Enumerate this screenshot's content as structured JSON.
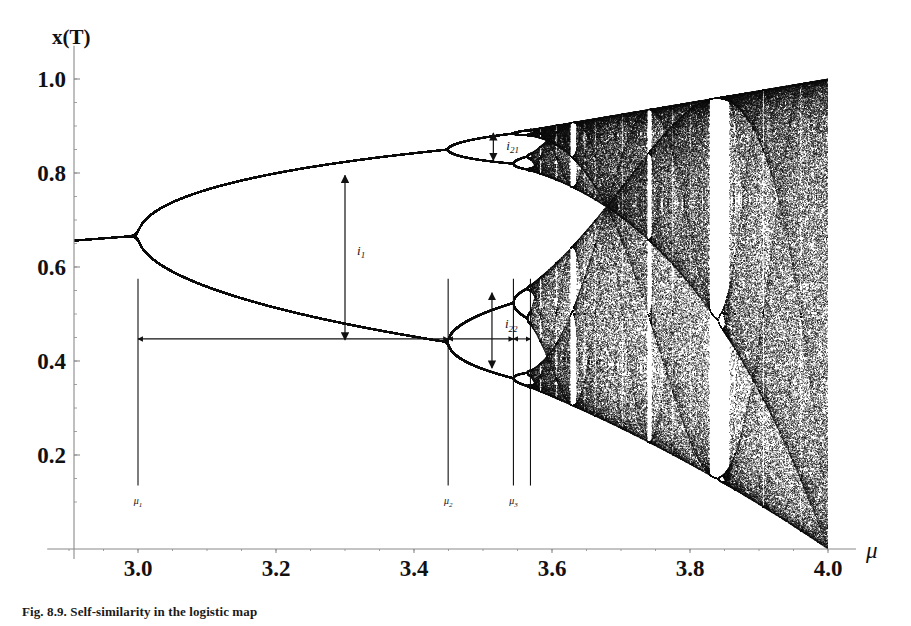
{
  "figure": {
    "caption": "Fig. 8.9.  Self-similarity in the logistic map",
    "y_axis_title": "x(T)",
    "x_axis_title": "μ"
  },
  "axes": {
    "x_ticks": [
      "3.0",
      "3.2",
      "3.4",
      "3.6",
      "3.8",
      "4.0"
    ],
    "x_tick_values": [
      3.0,
      3.2,
      3.4,
      3.6,
      3.8,
      4.0
    ],
    "y_ticks": [
      "1.0",
      "0.8",
      "0.6",
      "0.4",
      "0.2"
    ],
    "y_tick_values": [
      1.0,
      0.8,
      0.6,
      0.4,
      0.2
    ],
    "xlim": [
      2.88,
      4.04
    ],
    "ylim": [
      0.0,
      1.045
    ],
    "axis_color": "#8a8a8a"
  },
  "annotations": {
    "intervals": [
      {
        "name": "i1",
        "base": "i",
        "sub": "1",
        "x": 3.3,
        "y_top": 0.795,
        "y_bottom": 0.445,
        "label_dx": 12,
        "label_dy": -3
      },
      {
        "name": "i21",
        "base": "i",
        "sub": "21",
        "x": 3.515,
        "y_top": 0.885,
        "y_bottom": 0.827,
        "label_dx": 13,
        "label_dy": 3
      },
      {
        "name": "i22",
        "base": "i",
        "sub": "22",
        "x": 3.513,
        "y_top": 0.545,
        "y_bottom": 0.385,
        "label_dx": 13,
        "label_dy": -2
      }
    ],
    "mu_markers": [
      {
        "name": "mu1",
        "base": "μ",
        "sub": "1",
        "x": 3.0,
        "line_top_y": 0.575,
        "line_bottom_y": 0.135,
        "show_label": true
      },
      {
        "name": "mu2",
        "base": "μ",
        "sub": "2",
        "x": 3.4495,
        "line_top_y": 0.575,
        "line_bottom_y": 0.135,
        "show_label": true
      },
      {
        "name": "mu3",
        "base": "μ",
        "sub": "3",
        "x": 3.5441,
        "line_top_y": 0.575,
        "line_bottom_y": 0.135,
        "show_label": true
      },
      {
        "name": "mu4",
        "base": "μ",
        "sub": "4",
        "x": 3.5688,
        "line_top_y": 0.575,
        "line_bottom_y": 0.135,
        "show_label": false
      }
    ],
    "span_arrows": [
      {
        "name": "span-mu1-mu2",
        "x_from": 3.0,
        "x_to": 3.4495,
        "y": 0.447
      },
      {
        "name": "span-mu2-mu3",
        "x_from": 3.4495,
        "x_to": 3.5441,
        "y": 0.447
      },
      {
        "name": "span-mu3-mu4",
        "x_from": 3.5441,
        "x_to": 3.5688,
        "y": 0.447
      }
    ]
  },
  "chart_data": {
    "type": "line",
    "title": "Self-similarity in the logistic map",
    "xlabel": "μ",
    "ylabel": "x(T)",
    "xlim": [
      2.88,
      4.04
    ],
    "ylim": [
      0.0,
      1.045
    ],
    "grid": false,
    "legend": "none",
    "map": {
      "equation": "x_{n+1} = mu * x_n * (1 - x_n)",
      "transient_iterations": 320,
      "plotted_iterations": 260
    },
    "bifurcation_points": [
      {
        "label": "mu1",
        "mu": 3.0,
        "period_before": 1,
        "period_after": 2
      },
      {
        "label": "mu2",
        "mu": 3.4495,
        "period_before": 2,
        "period_after": 4
      },
      {
        "label": "mu3",
        "mu": 3.5441,
        "period_before": 4,
        "period_after": 8
      },
      {
        "label": "mu4",
        "mu": 3.5688,
        "period_before": 8,
        "period_after": 16
      }
    ],
    "feigenbaum_accumulation": 3.5699,
    "periodic_windows": [
      {
        "name": "period-6-window",
        "mu_start": 3.626,
        "mu_end": 3.636
      },
      {
        "name": "period-5-window",
        "mu_start": 3.738,
        "mu_end": 3.745
      },
      {
        "name": "period-3-window",
        "mu_start": 3.828,
        "mu_end": 3.857
      }
    ],
    "interval_measurements": [
      {
        "label": "i1",
        "mu": 3.3,
        "upper_branch": 0.795,
        "lower_branch": 0.445,
        "width": 0.35
      },
      {
        "label": "i21",
        "mu": 3.515,
        "upper_branch": 0.885,
        "lower_branch": 0.827,
        "width": 0.058
      },
      {
        "label": "i22",
        "mu": 3.513,
        "upper_branch": 0.545,
        "lower_branch": 0.385,
        "width": 0.16
      }
    ],
    "sampled_branches": {
      "note": "x values of the attractor branches sampled at selected mu",
      "mu": [
        2.9,
        3.0,
        3.1,
        3.2,
        3.3,
        3.4,
        3.4495,
        3.5,
        3.55,
        3.6,
        3.7,
        3.8,
        3.9,
        4.0
      ],
      "branches": [
        {
          "mu": 2.9,
          "x": [
            0.655
          ]
        },
        {
          "mu": 3.0,
          "x": [
            0.667
          ]
        },
        {
          "mu": 3.1,
          "x": [
            0.558,
            0.765
          ]
        },
        {
          "mu": 3.2,
          "x": [
            0.513,
            0.799
          ]
        },
        {
          "mu": 3.3,
          "x": [
            0.479,
            0.824
          ]
        },
        {
          "mu": 3.4,
          "x": [
            0.452,
            0.842
          ]
        },
        {
          "mu": 3.4495,
          "x": [
            0.44,
            0.849
          ]
        },
        {
          "mu": 3.5,
          "x": [
            0.383,
            0.501,
            0.827,
            0.875
          ]
        },
        {
          "mu": 3.55,
          "x": [
            0.355,
            0.37,
            0.506,
            0.549,
            0.815,
            0.847,
            0.879,
            0.887
          ]
        },
        {
          "mu": 3.6,
          "x": [
            0.327,
            0.38,
            0.51,
            0.57,
            0.79,
            0.87,
            0.89
          ]
        },
        {
          "mu": 3.7,
          "x": [
            0.25,
            0.925
          ]
        },
        {
          "mu": 3.8,
          "x": [
            0.16,
            0.95
          ]
        },
        {
          "mu": 3.9,
          "x": [
            0.09,
            0.975
          ]
        },
        {
          "mu": 4.0,
          "x": [
            0.0,
            1.0
          ]
        }
      ]
    }
  }
}
